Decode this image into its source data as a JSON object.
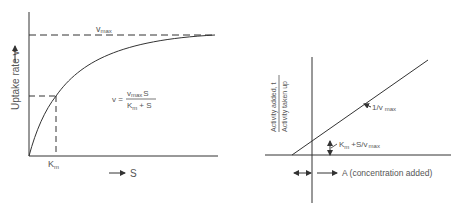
{
  "left_plot": {
    "y_axis_label": "Uptake rate v",
    "x_axis_label": "S",
    "vmax_label": "v",
    "vmax_sub": "max",
    "km_label": "K",
    "km_sub": "m",
    "equation": {
      "lhs": "v =",
      "num_v": "v",
      "num_sub": "max",
      "num_s": "S",
      "den_k": "K",
      "den_sub": "m",
      "den_rest": "+ S"
    }
  },
  "right_plot": {
    "y_axis_label_top": "Activity added, t",
    "y_axis_label_bottom": "Activity taken up",
    "x_axis_label": "A (concentration added)",
    "slope_label": "1/v",
    "slope_sub": "max",
    "intercept_label": "K",
    "intercept_sub": "m",
    "intercept_rest": "+S/v",
    "intercept_sub2": "max"
  },
  "colors": {
    "ink": "#333333",
    "text": "#555555"
  }
}
